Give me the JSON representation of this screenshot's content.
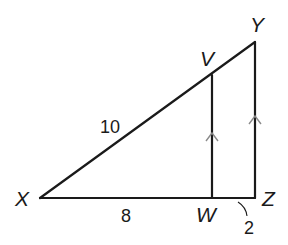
{
  "figure": {
    "type": "geometry-triangle-diagram",
    "line_color": "#1a1a1a",
    "marker_color": "#8a8a8a",
    "background": "#ffffff",
    "vertices": {
      "X": {
        "label": "X",
        "x": 40,
        "y": 198
      },
      "Y": {
        "label": "Y",
        "x": 255,
        "y": 42
      },
      "Z": {
        "label": "Z",
        "x": 255,
        "y": 198
      },
      "V": {
        "label": "V",
        "x": 212,
        "y": 75
      },
      "W": {
        "label": "W",
        "x": 212,
        "y": 198
      }
    },
    "segments": [
      {
        "name": "XY",
        "from": "X",
        "to": "Y"
      },
      {
        "name": "XZ",
        "from": "X",
        "to": "Z"
      },
      {
        "name": "YZ",
        "from": "Y",
        "to": "Z"
      },
      {
        "name": "VW",
        "from": "V",
        "to": "W"
      }
    ],
    "measurements": {
      "XV": "10",
      "XW": "8",
      "WZ": "2"
    },
    "parallel_marks": [
      "VW",
      "YZ"
    ]
  }
}
